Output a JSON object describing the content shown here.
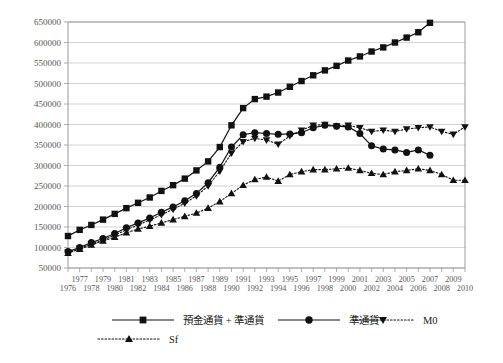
{
  "chart_data": {
    "type": "line",
    "title": "",
    "subtitle": "",
    "xlabel": "",
    "ylabel": "",
    "xlim": [
      1976,
      2010
    ],
    "ylim": [
      50000,
      650000
    ],
    "ytick_step": 50000,
    "grid": true,
    "legend_position": "bottom",
    "yticks": [
      50000,
      100000,
      150000,
      200000,
      250000,
      300000,
      350000,
      400000,
      450000,
      500000,
      550000,
      600000,
      650000
    ],
    "ytick_labels": [
      "50000",
      "100000",
      "150000",
      "200000",
      "250000",
      "300000",
      "350000",
      "400000",
      "450000",
      "500000",
      "550000",
      "600000",
      "650000"
    ],
    "x": [
      1976,
      1977,
      1978,
      1979,
      1980,
      1981,
      1982,
      1983,
      1984,
      1985,
      1986,
      1987,
      1988,
      1989,
      1990,
      1991,
      1992,
      1993,
      1994,
      1995,
      1996,
      1997,
      1998,
      1999,
      2000,
      2001,
      2002,
      2003,
      2004,
      2005,
      2006,
      2007,
      2008,
      2009,
      2010
    ],
    "xtick_labels_odd": [
      "1977",
      "1979",
      "1981",
      "1983",
      "1985",
      "1987",
      "1989",
      "1991",
      "1993",
      "1995",
      "1997",
      "1999",
      "2001",
      "2003",
      "2005",
      "2007",
      "2009"
    ],
    "xtick_labels_even": [
      "1976",
      "1978",
      "1980",
      "1982",
      "1984",
      "1986",
      "1988",
      "1990",
      "1992",
      "1994",
      "1996",
      "1998",
      "2000",
      "2002",
      "2004",
      "2006",
      "2008",
      "2010"
    ],
    "series": [
      {
        "name": "預金通貨 + 準通貨",
        "marker": "square",
        "linestyle": "solid",
        "color": "#111111",
        "values": [
          128000,
          143000,
          155000,
          168000,
          182000,
          196000,
          209000,
          222000,
          238000,
          252000,
          268000,
          288000,
          310000,
          345000,
          398000,
          440000,
          462000,
          468000,
          478000,
          492000,
          506000,
          520000,
          532000,
          543000,
          556000,
          566000,
          578000,
          588000,
          600000,
          612000,
          625000,
          648000,
          null,
          null,
          null
        ]
      },
      {
        "name": "準通貨",
        "marker": "circle",
        "linestyle": "solid",
        "color": "#111111",
        "values": [
          90000,
          100000,
          112000,
          122000,
          134000,
          148000,
          160000,
          172000,
          186000,
          199000,
          214000,
          232000,
          258000,
          296000,
          345000,
          375000,
          380000,
          378000,
          376000,
          377000,
          380000,
          392000,
          398000,
          396000,
          394000,
          378000,
          348000,
          340000,
          338000,
          332000,
          338000,
          325000,
          null,
          null,
          null
        ]
      },
      {
        "name": "M0",
        "marker": "triangle-down",
        "linestyle": "dotted",
        "color": "#111111",
        "values": [
          88000,
          98000,
          108000,
          118000,
          130000,
          143000,
          155000,
          167000,
          180000,
          193000,
          208000,
          226000,
          250000,
          286000,
          330000,
          358000,
          366000,
          362000,
          352000,
          372000,
          386000,
          398000,
          400000,
          396000,
          398000,
          392000,
          383000,
          386000,
          383000,
          389000,
          392000,
          394000,
          383000,
          376000,
          394000
        ]
      },
      {
        "name": "Sf",
        "marker": "triangle-up",
        "linestyle": "dotted",
        "color": "#111111",
        "values": [
          86000,
          96000,
          106000,
          116000,
          125000,
          136000,
          145000,
          152000,
          160000,
          168000,
          176000,
          184000,
          196000,
          212000,
          232000,
          252000,
          266000,
          272000,
          262000,
          278000,
          285000,
          290000,
          290000,
          292000,
          294000,
          288000,
          281000,
          278000,
          285000,
          288000,
          292000,
          288000,
          278000,
          264000,
          264000
        ]
      }
    ]
  },
  "legend": {
    "entries": [
      {
        "label": "預金通貨 + 準通貨",
        "marker": "square",
        "linestyle": "solid"
      },
      {
        "label": "準通貨",
        "marker": "circle",
        "linestyle": "solid"
      },
      {
        "label": "M0",
        "marker": "triangle-down",
        "linestyle": "dotted"
      },
      {
        "label": "Sf",
        "marker": "triangle-up",
        "linestyle": "dotted"
      }
    ]
  }
}
